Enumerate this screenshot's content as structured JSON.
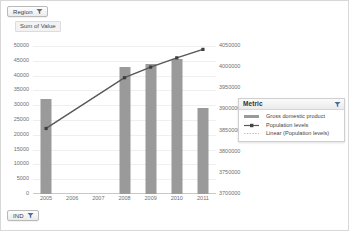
{
  "slicers": [
    {
      "id": "region",
      "label": "Region",
      "icon": "filter-funnel-icon"
    },
    {
      "id": "ind",
      "label": "IND",
      "icon": "filter-funnel-icon"
    }
  ],
  "value_caption": "Sum of Value",
  "legend": {
    "title": "Metric",
    "filter_icon": "filter-funnel-icon",
    "items": [
      {
        "label": "Gross domestic product",
        "marker": "bar",
        "color": "#9a9a9a"
      },
      {
        "label": "Population levels",
        "marker": "line-marker",
        "color": "#595959"
      },
      {
        "label": "Linear (Population levels)",
        "marker": "dotted-line",
        "color": "#bdbdbd"
      }
    ]
  },
  "chart_data": {
    "type": "bar",
    "title": "",
    "subtitle": "",
    "xlabel": "",
    "ylabel": "Sum of Value",
    "categories": [
      "2005",
      "2006",
      "2007",
      "2008",
      "2009",
      "2010",
      "2011"
    ],
    "grid": true,
    "legend_position": "right",
    "axes": {
      "left": {
        "label": "Sum of Value",
        "min": 0,
        "max": 50000,
        "step": 5000,
        "ticks": [
          "50000",
          "45000",
          "40000",
          "35000",
          "30000",
          "25000",
          "20000",
          "15000",
          "10000",
          "5000",
          "0"
        ]
      },
      "right": {
        "label": "Population levels",
        "min": 3700000,
        "max": 4050000,
        "step": 50000,
        "ticks": [
          "4050000",
          "4000000",
          "3950000",
          "3900000",
          "3850000",
          "3800000",
          "3750000",
          "3700000"
        ]
      }
    },
    "series": [
      {
        "name": "Gross domestic product",
        "type": "bar",
        "axis": "left",
        "color": "#9a9a9a",
        "values": [
          32000,
          null,
          null,
          43000,
          44000,
          45500,
          29000
        ]
      },
      {
        "name": "Population levels",
        "type": "line",
        "axis": "right",
        "color": "#595959",
        "values": [
          3855000,
          null,
          null,
          3975000,
          4000000,
          4022000,
          4042000
        ]
      },
      {
        "name": "Linear (Population levels)",
        "type": "trendline",
        "axis": "right",
        "color": "#bdbdbd",
        "style": "dotted",
        "values": [
          3855000,
          3895000,
          3935000,
          3975000,
          4000000,
          4022000,
          4042000
        ]
      }
    ]
  }
}
